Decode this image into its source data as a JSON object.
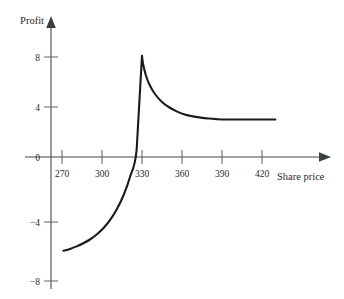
{
  "chart_data": {
    "type": "line",
    "title": "",
    "subtitle": "",
    "xlabel": "Share price",
    "ylabel": "Profit",
    "xlim": [
      262,
      440
    ],
    "ylim": [
      -9.2,
      9.6
    ],
    "xticks": [
      270,
      300,
      330,
      360,
      390,
      420
    ],
    "xticklabels": [
      "270",
      "300",
      "330",
      "360",
      "390",
      "420"
    ],
    "yticks": [
      8,
      4,
      0,
      -4,
      -8
    ],
    "yticklabels": [
      "8",
      "4",
      "0",
      "−4",
      "−8"
    ],
    "grid": false,
    "legend": null,
    "annotations": [],
    "series": [
      {
        "name": "Profit",
        "x": [
          271,
          276,
          281,
          286,
          291,
          296,
          301,
          306,
          311,
          316,
          321,
          326,
          330,
          330.5,
          333,
          336,
          340,
          345,
          350,
          356,
          362,
          368,
          374,
          380,
          386,
          392,
          400,
          410,
          420,
          430
        ],
        "y": [
          -7.5,
          -7.35,
          -7.15,
          -6.9,
          -6.6,
          -6.2,
          -5.7,
          -5.05,
          -4.2,
          -3.1,
          -1.6,
          0.6,
          8.1,
          7.6,
          6.5,
          5.7,
          5.0,
          4.4,
          4.0,
          3.65,
          3.4,
          3.25,
          3.15,
          3.08,
          3.03,
          3.0,
          3.0,
          3.0,
          3.0,
          3.0
        ]
      }
    ],
    "peak": {
      "x": 330,
      "y": 8.1
    },
    "asymptote": {
      "y": 3.0
    },
    "zero_crossing": {
      "x": 322
    }
  },
  "axes": {
    "y_axis_label": "Profit",
    "x_axis_label": "Share price",
    "origin_label": "0"
  }
}
